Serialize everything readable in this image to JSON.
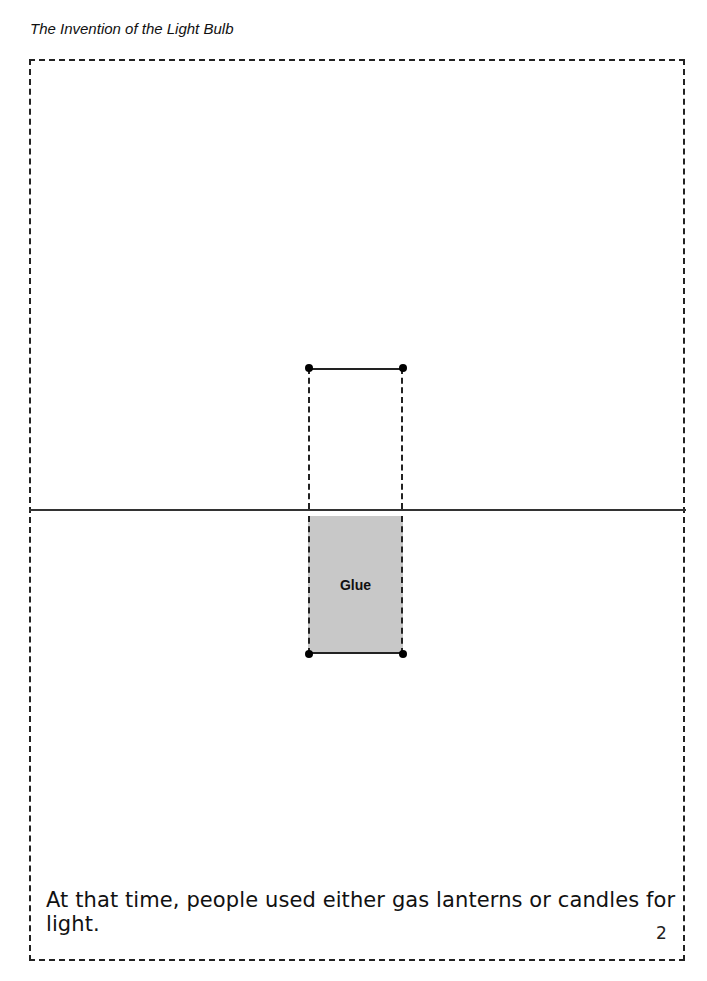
{
  "header": {
    "title": "The Invention of the Light Bulb"
  },
  "tab": {
    "glue_label": "Glue"
  },
  "page": {
    "sentence": "At that time, people used either gas lanterns or candles for light.",
    "number": "2"
  },
  "colors": {
    "glue_fill": "#c8c8c8",
    "line": "#222222"
  }
}
